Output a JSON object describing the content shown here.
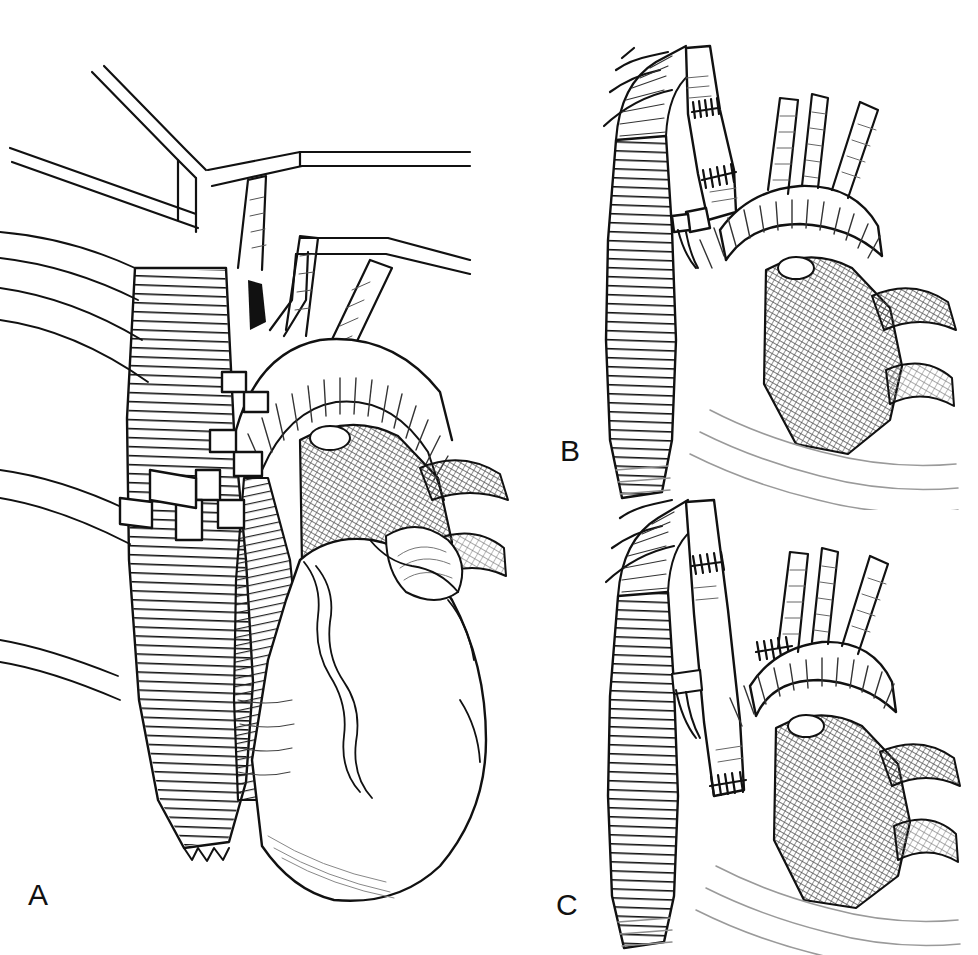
{
  "figure": {
    "background_color": "#ffffff",
    "ink_color": "#111111",
    "shade_color": "#6a6a6a",
    "width": 978,
    "height": 955
  },
  "panels": [
    {
      "id": "A",
      "label": "A",
      "caption": "Exposure of aortic arch and descending aorta with retractors; native vessel anatomy and heart in view",
      "label_x": 28,
      "label_y": 880
    },
    {
      "id": "B",
      "label": "B",
      "caption": "Short interposition bypass graft sutured proximally and distally across the arch",
      "label_x": 560,
      "label_y": 436
    },
    {
      "id": "C",
      "label": "C",
      "caption": "Long extra-anatomic bypass graft with proximal and distal anastomoses to ascending aorta",
      "label_x": 556,
      "label_y": 890
    }
  ],
  "anatomy": {
    "structures": [
      "descending thoracic aorta",
      "aortic arch",
      "ascending aorta",
      "brachiocephalic trunk",
      "left common carotid artery",
      "left subclavian artery",
      "pulmonary artery",
      "heart — right ventricle",
      "heart — left ventricle",
      "left atrial appendage",
      "intercostal arteries",
      "bypass graft conduit",
      "suture anastomosis line",
      "surgical retractor",
      "vascular clamp"
    ]
  },
  "render": {
    "hatch_line_color": "#111111",
    "fine_hatch_color": "#5c5c5c",
    "stipple_color": "#707070",
    "outline_width": 2.2,
    "hatch_width": 1.1
  }
}
